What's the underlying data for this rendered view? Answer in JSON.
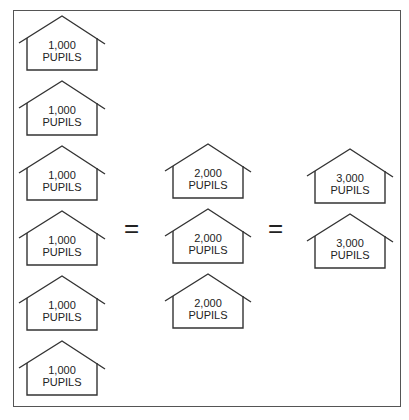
{
  "diagram": {
    "column_1": [
      {
        "count": "1,000",
        "unit": "PUPILS"
      },
      {
        "count": "1,000",
        "unit": "PUPILS"
      },
      {
        "count": "1,000",
        "unit": "PUPILS"
      },
      {
        "count": "1,000",
        "unit": "PUPILS"
      },
      {
        "count": "1,000",
        "unit": "PUPILS"
      },
      {
        "count": "1,000",
        "unit": "PUPILS"
      }
    ],
    "column_2": [
      {
        "count": "2,000",
        "unit": "PUPILS"
      },
      {
        "count": "2,000",
        "unit": "PUPILS"
      },
      {
        "count": "2,000",
        "unit": "PUPILS"
      }
    ],
    "column_3": [
      {
        "count": "3,000",
        "unit": "PUPILS"
      },
      {
        "count": "3,000",
        "unit": "PUPILS"
      }
    ],
    "equals_1": "=",
    "equals_2": "="
  }
}
